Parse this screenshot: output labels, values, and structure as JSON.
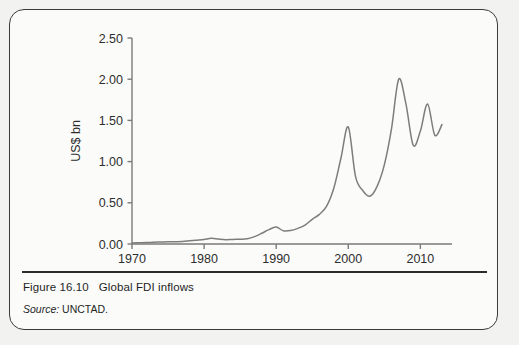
{
  "figure": {
    "number_label": "Figure 16.10",
    "title": "Global FDI inflows",
    "source_label": "Source:",
    "source_value": "UNCTAD."
  },
  "chart_data": {
    "type": "line",
    "title": "Global FDI inflows",
    "xlabel": "",
    "ylabel": "US$ bn",
    "xlim": [
      1970,
      2013
    ],
    "ylim": [
      0.0,
      2.5
    ],
    "grid": false,
    "legend": null,
    "line_color": "#7d7d7d",
    "axis_color": "#7a7a7a",
    "x_ticks": [
      1970,
      1980,
      1990,
      2000,
      2010
    ],
    "x_tick_labels": [
      "1970",
      "1980",
      "1990",
      "2000",
      "2010"
    ],
    "y_ticks": [
      0.0,
      0.5,
      1.0,
      1.5,
      2.0,
      2.5
    ],
    "y_tick_labels": [
      "0.00",
      "0.50",
      "1.00",
      "1.50",
      "2.00",
      "2.50"
    ],
    "x": [
      1970,
      1971,
      1972,
      1973,
      1974,
      1975,
      1976,
      1977,
      1978,
      1979,
      1980,
      1981,
      1982,
      1983,
      1984,
      1985,
      1986,
      1987,
      1988,
      1989,
      1990,
      1991,
      1992,
      1993,
      1994,
      1995,
      1996,
      1997,
      1998,
      1999,
      2000,
      2001,
      2002,
      2003,
      2004,
      2005,
      2006,
      2007,
      2008,
      2009,
      2010,
      2011,
      2012,
      2013
    ],
    "values": [
      0.013,
      0.015,
      0.017,
      0.022,
      0.024,
      0.027,
      0.028,
      0.03,
      0.038,
      0.046,
      0.055,
      0.07,
      0.06,
      0.053,
      0.056,
      0.058,
      0.065,
      0.09,
      0.13,
      0.175,
      0.205,
      0.16,
      0.163,
      0.19,
      0.23,
      0.3,
      0.36,
      0.46,
      0.68,
      1.05,
      1.42,
      0.82,
      0.65,
      0.58,
      0.7,
      0.96,
      1.4,
      2.0,
      1.7,
      1.2,
      1.37,
      1.7,
      1.32,
      1.45
    ]
  }
}
